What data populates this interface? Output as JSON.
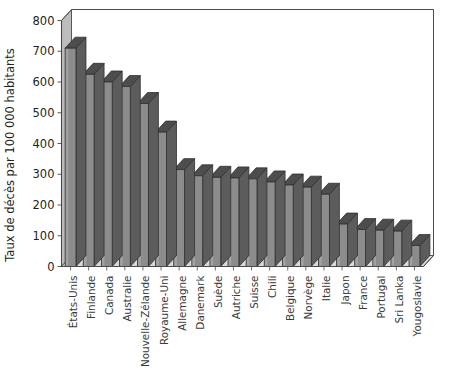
{
  "chart_data": {
    "type": "bar",
    "title": "",
    "subtitle": "",
    "xlabel": "",
    "ylabel": "Taux de décès par 100 000 habitants",
    "ylim": [
      0,
      800
    ],
    "ytick_labels": [
      "0",
      "100",
      "200",
      "300",
      "400",
      "500",
      "600",
      "700",
      "800"
    ],
    "ytick_values": [
      0,
      100,
      200,
      300,
      400,
      500,
      600,
      700,
      800
    ],
    "ytick_interval": 100,
    "grid": false,
    "legend": null,
    "legend_position": "none",
    "style": "3d-column",
    "categories": [
      "États-Unis",
      "Finlande",
      "Canada",
      "Australie",
      "Nouvelle-Zélande",
      "Royaume-Uni",
      "Allemagne",
      "Danemark",
      "Suède",
      "Autriche",
      "Suisse",
      "Chili",
      "Belgique",
      "Norvège",
      "Italie",
      "Japon",
      "France",
      "Portugal",
      "Sri Lanka",
      "Yougoslavie"
    ],
    "values": [
      710,
      625,
      600,
      585,
      530,
      437,
      315,
      295,
      290,
      288,
      285,
      275,
      265,
      258,
      235,
      138,
      120,
      118,
      115,
      68
    ],
    "annotations": []
  },
  "colors": {
    "bar_front": "#8c8c8c",
    "bar_top": "#4d4d4d",
    "bar_side": "#5c5c5c",
    "wall_left": "#bdbdbd",
    "floor": "#d9d9d9",
    "axis_line": "#4a4a4a",
    "text": "#231f20",
    "label_text": "#3a3a3a",
    "background": "#ffffff"
  }
}
